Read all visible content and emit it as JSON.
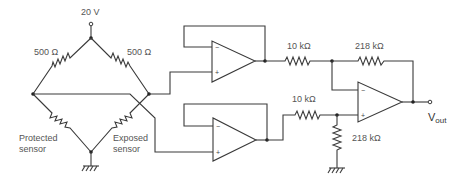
{
  "diagram": {
    "type": "circuit-schematic",
    "supply": {
      "label": "20 V"
    },
    "bridge": {
      "top_left_resistor": {
        "label": "500 Ω"
      },
      "top_right_resistor": {
        "label": "500 Ω"
      },
      "bottom_left_sensor": {
        "label_line1": "Protected",
        "label_line2": "sensor"
      },
      "bottom_right_sensor": {
        "label_line1": "Exposed",
        "label_line2": "sensor"
      }
    },
    "buffers": [
      {
        "name": "upper-buffer",
        "minus": "−",
        "plus": "+"
      },
      {
        "name": "lower-buffer",
        "minus": "−",
        "plus": "+"
      }
    ],
    "difference_amplifier": {
      "input_resistor_top": {
        "label": "10 kΩ"
      },
      "input_resistor_bottom": {
        "label": "10 kΩ"
      },
      "feedback_resistor": {
        "label": "218 kΩ"
      },
      "ground_resistor": {
        "label": "218 kΩ"
      },
      "minus": "−",
      "plus": "+"
    },
    "output": {
      "label_main": "V",
      "label_sub": "out"
    }
  }
}
